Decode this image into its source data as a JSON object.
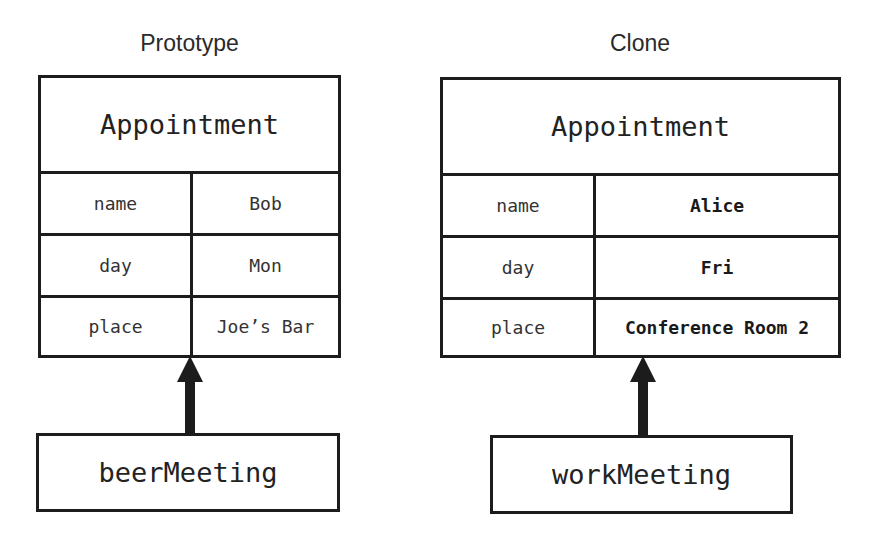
{
  "diagram": {
    "left": {
      "title": "Prototype",
      "class_name": "Appointment",
      "rows": [
        {
          "key": "name",
          "value": "Bob"
        },
        {
          "key": "day",
          "value": "Mon"
        },
        {
          "key": "place",
          "value": "Joe’s Bar"
        }
      ],
      "object_name": "beerMeeting"
    },
    "right": {
      "title": "Clone",
      "class_name": "Appointment",
      "rows": [
        {
          "key": "name",
          "value": "Alice"
        },
        {
          "key": "day",
          "value": "Fri"
        },
        {
          "key": "place",
          "value": "Conference Room 2"
        }
      ],
      "object_name": "workMeeting"
    },
    "colors": {
      "line": "#1c1c1c",
      "text": "#222222",
      "background": "#ffffff"
    }
  }
}
